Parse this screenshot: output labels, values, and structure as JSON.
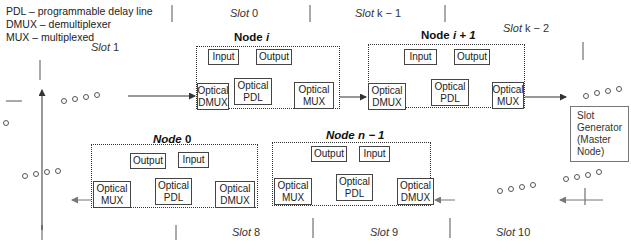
{
  "legend": [
    "PDL – programmable delay line",
    "DMUX – demultiplexer",
    "MUX – multiplexed"
  ],
  "slots": {
    "s0": {
      "word": "Slot",
      "num": " 0"
    },
    "sk1": {
      "word": "Slot",
      "num": " k − 1"
    },
    "sk2": {
      "word": "Slot",
      "num": " k − 2"
    },
    "s1": {
      "word": "Slot",
      "num": " 1"
    },
    "s8": {
      "word": "Slot",
      "num": " 8"
    },
    "s9": {
      "word": "Slot",
      "num": " 9"
    },
    "s10": {
      "word": "Slot",
      "num": " 10"
    }
  },
  "nodes": {
    "node_i": {
      "prefix": "Node",
      "var": "  i",
      "input": "Input",
      "output": "Output",
      "dmux": [
        "Optical",
        "DMUX"
      ],
      "pdl": [
        "Optical",
        "PDL"
      ],
      "mux": [
        "Optical",
        "MUX"
      ]
    },
    "node_i1": {
      "prefix": "Node",
      "var": "  i + 1",
      "input": "Input",
      "output": "Output",
      "dmux": [
        "Optical",
        "DMUX"
      ],
      "pdl": [
        "Optical",
        "PDL"
      ],
      "mux": [
        "Optical",
        "MUX"
      ]
    },
    "node_0": {
      "prefix": "Node",
      "var": " 0",
      "input": "Input",
      "output": "Output",
      "dmux": [
        "Optical",
        "DMUX"
      ],
      "pdl": [
        "Optical",
        "PDL"
      ],
      "mux": [
        "Optical",
        "MUX"
      ]
    },
    "node_n1": {
      "prefix": "Node",
      "var": "  n − 1",
      "input": "Input",
      "output": "Output",
      "dmux": [
        "Optical",
        "DMUX"
      ],
      "pdl": [
        "Optical",
        "PDL"
      ],
      "mux": [
        "Optical",
        "MUX"
      ]
    }
  },
  "generator": [
    "Slot",
    "Generator",
    "(Master",
    "Node)"
  ],
  "colors": {
    "line": "#333333",
    "border": "#444444",
    "text": "#222222"
  }
}
